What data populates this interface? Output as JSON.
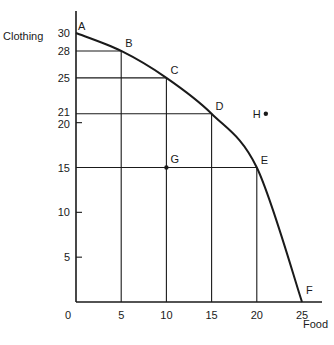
{
  "chart_data": {
    "type": "line",
    "title": "",
    "xlabel": "Food",
    "ylabel": "Clothing",
    "xlim": [
      0,
      25
    ],
    "ylim": [
      0,
      30
    ],
    "grid": false,
    "x_ticks": [
      0,
      5,
      10,
      15,
      20,
      25
    ],
    "x_tick_labels": [
      "0",
      "5",
      "10",
      "15",
      "20",
      "25"
    ],
    "y_ticks": [
      5,
      10,
      15,
      20,
      21,
      25,
      28,
      30
    ],
    "y_tick_labels": [
      "5",
      "10",
      "15",
      "20",
      "21",
      "25",
      "28",
      "30"
    ],
    "series": [
      {
        "name": "Production Possibilities Frontier",
        "points": [
          {
            "label": "A",
            "x": 0,
            "y": 30
          },
          {
            "label": "B",
            "x": 5,
            "y": 28
          },
          {
            "label": "C",
            "x": 10,
            "y": 25
          },
          {
            "label": "D",
            "x": 15,
            "y": 21
          },
          {
            "label": "E",
            "x": 20,
            "y": 15
          },
          {
            "label": "F",
            "x": 25,
            "y": 0
          }
        ]
      }
    ],
    "extra_points": [
      {
        "label": "G",
        "x": 10,
        "y": 15
      },
      {
        "label": "H",
        "x": 21,
        "y": 21
      }
    ],
    "guide_lines_for": [
      "B",
      "C",
      "D",
      "E"
    ],
    "short_ticks_y": [
      5,
      10,
      20
    ]
  }
}
